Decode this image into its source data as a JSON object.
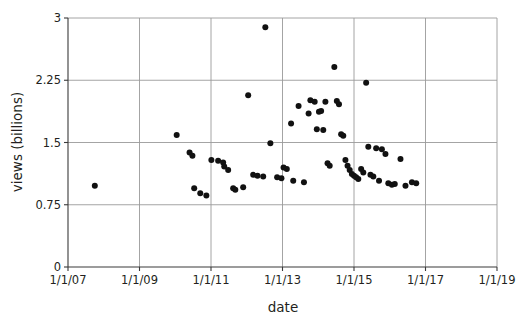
{
  "chart_data": {
    "type": "scatter",
    "title": "",
    "xlabel": "date",
    "ylabel": "views (billions)",
    "grid": true,
    "legend": null,
    "x_tick_labels": [
      "1/1/07",
      "1/1/09",
      "1/1/11",
      "1/1/13",
      "1/1/15",
      "1/1/17",
      "1/1/19"
    ],
    "x_tick_values": [
      2007.0,
      2009.0,
      2011.0,
      2013.0,
      2015.0,
      2017.0,
      2019.0
    ],
    "y_tick_labels": [
      "0",
      "0.75",
      "1.5",
      "2.25",
      "3"
    ],
    "y_tick_values": [
      0,
      0.75,
      1.5,
      2.25,
      3
    ],
    "xlim": [
      2007.0,
      2019.0
    ],
    "ylim": [
      0,
      3
    ],
    "x_unit": "date (year)",
    "y_unit": "views (billions)",
    "point_count": 68,
    "points": [
      {
        "x": 2007.75,
        "y": 0.98
      },
      {
        "x": 2010.04,
        "y": 1.59
      },
      {
        "x": 2010.4,
        "y": 1.38
      },
      {
        "x": 2010.48,
        "y": 1.34
      },
      {
        "x": 2010.53,
        "y": 0.95
      },
      {
        "x": 2010.7,
        "y": 0.89
      },
      {
        "x": 2010.87,
        "y": 0.86
      },
      {
        "x": 2011.01,
        "y": 1.29
      },
      {
        "x": 2011.2,
        "y": 1.28
      },
      {
        "x": 2011.34,
        "y": 1.26
      },
      {
        "x": 2011.37,
        "y": 1.21
      },
      {
        "x": 2011.48,
        "y": 1.17
      },
      {
        "x": 2011.62,
        "y": 0.95
      },
      {
        "x": 2011.68,
        "y": 0.93
      },
      {
        "x": 2011.9,
        "y": 0.96
      },
      {
        "x": 2012.04,
        "y": 2.07
      },
      {
        "x": 2012.18,
        "y": 1.11
      },
      {
        "x": 2012.3,
        "y": 1.1
      },
      {
        "x": 2012.46,
        "y": 1.09
      },
      {
        "x": 2012.52,
        "y": 2.89
      },
      {
        "x": 2012.66,
        "y": 1.49
      },
      {
        "x": 2012.85,
        "y": 1.08
      },
      {
        "x": 2012.97,
        "y": 1.07
      },
      {
        "x": 2013.03,
        "y": 1.2
      },
      {
        "x": 2013.12,
        "y": 1.18
      },
      {
        "x": 2013.24,
        "y": 1.73
      },
      {
        "x": 2013.3,
        "y": 1.04
      },
      {
        "x": 2013.45,
        "y": 1.94
      },
      {
        "x": 2013.6,
        "y": 1.02
      },
      {
        "x": 2013.73,
        "y": 1.85
      },
      {
        "x": 2013.78,
        "y": 2.01
      },
      {
        "x": 2013.9,
        "y": 1.99
      },
      {
        "x": 2013.96,
        "y": 1.66
      },
      {
        "x": 2014.02,
        "y": 1.87
      },
      {
        "x": 2014.08,
        "y": 1.88
      },
      {
        "x": 2014.14,
        "y": 1.65
      },
      {
        "x": 2014.2,
        "y": 1.99
      },
      {
        "x": 2014.26,
        "y": 1.25
      },
      {
        "x": 2014.32,
        "y": 1.22
      },
      {
        "x": 2014.45,
        "y": 2.41
      },
      {
        "x": 2014.52,
        "y": 2.0
      },
      {
        "x": 2014.58,
        "y": 1.96
      },
      {
        "x": 2014.64,
        "y": 1.6
      },
      {
        "x": 2014.7,
        "y": 1.58
      },
      {
        "x": 2014.76,
        "y": 1.29
      },
      {
        "x": 2014.82,
        "y": 1.22
      },
      {
        "x": 2014.88,
        "y": 1.17
      },
      {
        "x": 2014.94,
        "y": 1.12
      },
      {
        "x": 2015.0,
        "y": 1.1
      },
      {
        "x": 2015.06,
        "y": 1.08
      },
      {
        "x": 2015.12,
        "y": 1.06
      },
      {
        "x": 2015.2,
        "y": 1.18
      },
      {
        "x": 2015.26,
        "y": 1.14
      },
      {
        "x": 2015.34,
        "y": 2.22
      },
      {
        "x": 2015.4,
        "y": 1.45
      },
      {
        "x": 2015.46,
        "y": 1.11
      },
      {
        "x": 2015.54,
        "y": 1.09
      },
      {
        "x": 2015.62,
        "y": 1.43
      },
      {
        "x": 2015.7,
        "y": 1.04
      },
      {
        "x": 2015.78,
        "y": 1.42
      },
      {
        "x": 2015.88,
        "y": 1.36
      },
      {
        "x": 2015.96,
        "y": 1.01
      },
      {
        "x": 2016.06,
        "y": 0.99
      },
      {
        "x": 2016.14,
        "y": 1.0
      },
      {
        "x": 2016.3,
        "y": 1.3
      },
      {
        "x": 2016.44,
        "y": 0.98
      },
      {
        "x": 2016.62,
        "y": 1.02
      },
      {
        "x": 2016.74,
        "y": 1.01
      }
    ]
  },
  "colors": {
    "point": "#111111",
    "grid": "#9a9a9a",
    "axis": "#3a3a3a",
    "text": "#231f20",
    "background": "#ffffff"
  }
}
